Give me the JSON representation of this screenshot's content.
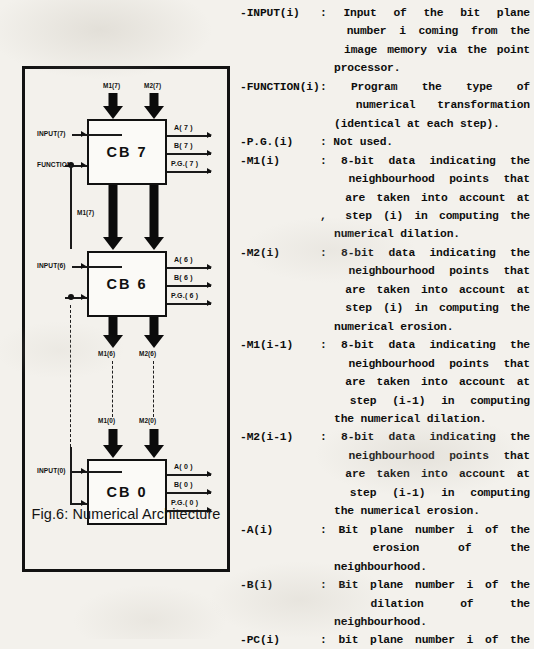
{
  "figure": {
    "caption": "Fig.6: Numerical Architecture",
    "blocks": [
      {
        "name": "CB 7",
        "index": "7"
      },
      {
        "name": "CB 6",
        "index": "6"
      },
      {
        "name": "CB 0",
        "index": "0"
      }
    ],
    "inputs": {
      "input7": "INPUT(7)",
      "input6": "INPUT(6)",
      "input0": "INPUT(0)",
      "function": "FUNCTION"
    },
    "bus_labels": {
      "m1_7_top": "M1(7)",
      "m2_7_top": "M2(7)",
      "m1_7_mid": "M1(7)",
      "m1_6": "M1(6)",
      "m2_6": "M2(6)",
      "m1_0": "M1(0)",
      "m2_0": "M2(0)"
    },
    "outputs": {
      "cb7": [
        "A( 7 )",
        "B( 7 )",
        "P.G.( 7 )"
      ],
      "cb6": [
        "A( 6 )",
        "B( 6 )",
        "P.G.( 6 )"
      ],
      "cb0": [
        "A( 0 )",
        "B( 0 )",
        "P.G.( 0 )"
      ]
    }
  },
  "glossary": {
    "entries": [
      {
        "term": "-INPUT(i)",
        "colon": ":",
        "lines": [
          [
            "Input",
            "of",
            "the",
            "bit",
            "plane"
          ],
          [
            "number",
            "i",
            "coming",
            "from",
            "the"
          ],
          [
            "image",
            "memory",
            "via",
            "the",
            "point"
          ]
        ],
        "last": "processor."
      },
      {
        "term": "-FUNCTION(i)",
        "colon": ":",
        "lines": [
          [
            "Program",
            "the",
            "type",
            "of"
          ],
          [
            "numerical",
            "transformation"
          ]
        ],
        "last": "(identical at each step)."
      },
      {
        "term": "-P.G.(i)",
        "colon": ":",
        "lines": [],
        "last": "Not used."
      },
      {
        "term": "-M1(i)",
        "colon": ":",
        "lines": [
          [
            "8-bit",
            "data",
            "indicating",
            "the"
          ],
          [
            "neighbourhood",
            "points",
            "that"
          ],
          [
            "are",
            "taken",
            "into",
            "account",
            "at"
          ],
          [
            "step",
            "(i)",
            "in",
            "computing",
            "the"
          ]
        ],
        "last": "numerical dilation.",
        "artifact": ","
      },
      {
        "term": "-M2(i)",
        "colon": ":",
        "lines": [
          [
            "8-bit",
            "data",
            "indicating",
            "the"
          ],
          [
            "neighbourhood",
            "points",
            "that"
          ],
          [
            "are",
            "taken",
            "into",
            "account",
            "at"
          ],
          [
            "step",
            "(i)",
            "in",
            "computing",
            "the"
          ]
        ],
        "last": "numerical erosion."
      },
      {
        "term": "-M1(i-1)",
        "colon": ":",
        "lines": [
          [
            "8-bit",
            "data",
            "indicating",
            "the"
          ],
          [
            "neighbourhood",
            "points",
            "that"
          ],
          [
            "are",
            "taken",
            "into",
            "account",
            "at"
          ],
          [
            "step",
            "(i-1)",
            "in",
            "computing"
          ]
        ],
        "last": "the numerical dilation."
      },
      {
        "term": "-M2(i-1)",
        "colon": ":",
        "lines": [
          [
            "8-bit",
            "data",
            "indicating",
            "the"
          ],
          [
            "neighbourhood",
            "points",
            "that"
          ],
          [
            "are",
            "taken",
            "into",
            "account",
            "at"
          ],
          [
            "step",
            "(i-1)",
            "in",
            "computing"
          ]
        ],
        "last": "the numerical erosion."
      },
      {
        "term": "-A(i)",
        "colon": ":",
        "lines": [
          [
            "Bit",
            "plane",
            "number",
            "i",
            "of",
            "the"
          ],
          [
            "erosion",
            "of",
            "the"
          ]
        ],
        "last": "neighbourhood."
      },
      {
        "term": "-B(i)",
        "colon": ":",
        "lines": [
          [
            "Bit",
            "plane",
            "number",
            "i",
            "of",
            "the"
          ],
          [
            "dilation",
            "of",
            "the"
          ]
        ],
        "last": "neighbourhood."
      },
      {
        "term": "-PC(i)",
        "colon": ":",
        "lines": [
          [
            "bit",
            "plane",
            "number",
            "i",
            "of",
            "the"
          ]
        ],
        "last": ""
      }
    ]
  },
  "colors": {
    "ink": "#111111",
    "paper": "#f3f1ec"
  }
}
